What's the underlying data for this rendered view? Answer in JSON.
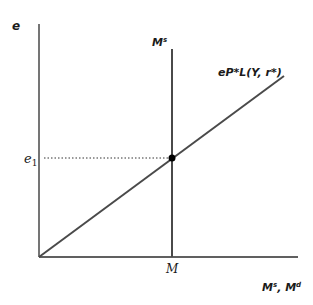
{
  "diagram": {
    "y_axis_label": "e",
    "x_axis_label": {
      "base1": "M",
      "sup1": "s",
      "sep": ", ",
      "base2": "M",
      "sup2": "d"
    },
    "supply_curve_label": {
      "base": "M",
      "sup": "s"
    },
    "demand_curve_label": "eP*L(Y, r*)",
    "equilibrium_e_label": {
      "base": "e",
      "sub": "1"
    },
    "equilibrium_m_label": "M",
    "colors": {
      "axis": "#2b2b2b",
      "curve": "#4a4a4a",
      "point": "#000000",
      "dotted": "#333333"
    }
  }
}
